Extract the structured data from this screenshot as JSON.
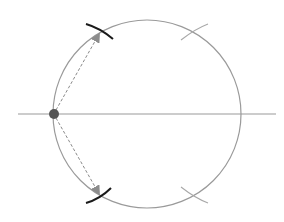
{
  "diagram": {
    "canvas": {
      "width": 284,
      "height": 222,
      "background": "#ffffff"
    },
    "colors": {
      "circle": "#9a9a9a",
      "axis": "#9a9a9a",
      "point": "#555555",
      "arrow": "#8a8a8a",
      "arrowhead": "#8c8c8c",
      "dark_arc": "#1a1a1a",
      "faint_arc": "#a8a8a8"
    },
    "circle": {
      "cx": 147,
      "cy": 114,
      "r": 94
    },
    "axis_line": {
      "x1": 18,
      "y1": 114,
      "x2": 276,
      "y2": 114
    },
    "center_point": {
      "cx": 54,
      "cy": 114,
      "r": 5,
      "label": "pivot-point"
    },
    "arrows": [
      {
        "name": "upper",
        "x1": 56,
        "y1": 110,
        "x2": 98,
        "y2": 36
      },
      {
        "name": "lower",
        "x1": 56,
        "y1": 118,
        "x2": 98,
        "y2": 192
      }
    ],
    "dark_arcs": [
      {
        "name": "upper",
        "d": "M 86 24 Q 100 28 113 39"
      },
      {
        "name": "lower",
        "d": "M 86 203 Q 100 199 111 188"
      }
    ],
    "faint_arcs": [
      {
        "name": "upper-right",
        "d": "M 181 40 Q 195 29 208 24"
      },
      {
        "name": "lower-right",
        "d": "M 181 187 Q 195 198 208 203"
      }
    ]
  }
}
